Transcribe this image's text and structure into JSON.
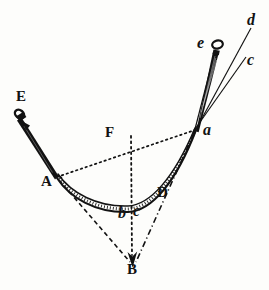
{
  "figure": {
    "background_color": "#fdfdfb",
    "ink_color": "#121212",
    "width": 269,
    "height": 290
  },
  "labels": [
    {
      "id": "E",
      "text": "E",
      "style": "capital",
      "x": 16,
      "y": 89,
      "note": "upper-left pivot nail label"
    },
    {
      "id": "A",
      "text": "A",
      "style": "capital",
      "x": 41,
      "y": 174,
      "note": "left end of arc"
    },
    {
      "id": "F",
      "text": "F",
      "style": "capital",
      "x": 105,
      "y": 125,
      "note": "midpoint on chord, top of vertical dotted line"
    },
    {
      "id": "B",
      "text": "B",
      "style": "capital",
      "x": 127,
      "y": 262,
      "note": "lower vertex / center of convergence"
    },
    {
      "id": "D",
      "text": "D",
      "style": "capital",
      "x": 157,
      "y": 185,
      "note": "right lower marker on dash-dot ray"
    },
    {
      "id": "a",
      "text": "a",
      "style": "lowercase",
      "x": 203,
      "y": 122,
      "note": "upper-right convergence point"
    },
    {
      "id": "b",
      "text": "b",
      "style": "lowercase",
      "x": 118,
      "y": 205,
      "note": "bottom of arc, left of center"
    },
    {
      "id": "c-low",
      "text": "c",
      "style": "lowercase",
      "x": 133,
      "y": 203,
      "note": "bottom of arc, right of center"
    },
    {
      "id": "e",
      "text": "e",
      "style": "lowercase",
      "x": 197,
      "y": 35,
      "note": "label beside the needle"
    },
    {
      "id": "d",
      "text": "d",
      "style": "lowercase",
      "x": 247,
      "y": 12,
      "note": "top-right ray d"
    },
    {
      "id": "c-up",
      "text": "c",
      "style": "lowercase",
      "x": 247,
      "y": 52,
      "note": "upper-right ray c"
    }
  ],
  "geometry": {
    "points": {
      "E_head": [
        20,
        116
      ],
      "A": [
        58,
        176
      ],
      "F_top": [
        130,
        137
      ],
      "F_cross": [
        131,
        152
      ],
      "B": [
        133,
        268
      ],
      "D": [
        166,
        190
      ],
      "a": [
        196,
        129
      ],
      "b": [
        125,
        200
      ],
      "c": [
        140,
        198
      ],
      "needle_head": [
        218,
        41
      ],
      "needle_tip": [
        196,
        129
      ],
      "d_end": [
        252,
        30
      ],
      "c_end": [
        248,
        60
      ]
    },
    "strokes": [
      {
        "name": "nail-bar-EA",
        "type": "tapered-bar",
        "from": "E_head",
        "to": "A",
        "style": "solid-thick"
      },
      {
        "name": "arc-AabcD",
        "type": "arc-band",
        "style": "double-line-hatched"
      },
      {
        "name": "chord-A-to-a",
        "type": "line",
        "style": "dotted"
      },
      {
        "name": "vertical-F-to-B",
        "type": "line",
        "style": "dotted",
        "arrowhead": true
      },
      {
        "name": "radius-A-to-B",
        "type": "line",
        "style": "dashed"
      },
      {
        "name": "radius-a-to-B",
        "type": "line",
        "style": "dash-dot",
        "through": "D"
      },
      {
        "name": "needle-at-a",
        "type": "tapered-bar",
        "style": "solid-thick"
      },
      {
        "name": "ray-a-to-d",
        "type": "line",
        "style": "solid-thin"
      },
      {
        "name": "ray-a-to-c",
        "type": "line",
        "style": "solid-thin"
      },
      {
        "name": "ray-a-to-e",
        "type": "line",
        "style": "solid-thin"
      }
    ]
  }
}
